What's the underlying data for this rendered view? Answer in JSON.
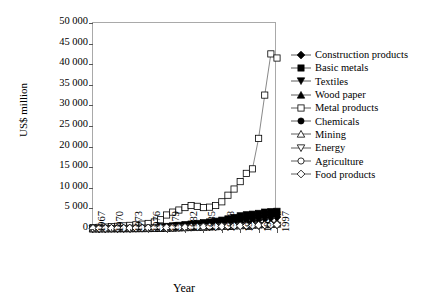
{
  "chart_data": {
    "type": "line",
    "title": "",
    "xlabel": "Year",
    "ylabel": "US$ million",
    "xlim": [
      1967,
      1997
    ],
    "ylim": [
      0,
      50000
    ],
    "ytick_labels": [
      "50 000",
      "45 000",
      "40 000",
      "35 000",
      "30 000",
      "25 000",
      "20 000",
      "15 000",
      "10 000",
      "5 000",
      "0"
    ],
    "ytick_values": [
      50000,
      45000,
      40000,
      35000,
      30000,
      25000,
      20000,
      15000,
      10000,
      5000,
      0
    ],
    "xtick_labels": [
      "1967",
      "1970",
      "1973",
      "1976",
      "1979",
      "1982",
      "1985",
      "1988",
      "1991",
      "1994",
      "1997"
    ],
    "xtick_values": [
      1967,
      1970,
      1973,
      1976,
      1979,
      1982,
      1985,
      1988,
      1991,
      1994,
      1997
    ],
    "grid": false,
    "legend_position": "right",
    "x": [
      1967,
      1968,
      1969,
      1970,
      1971,
      1972,
      1973,
      1974,
      1975,
      1976,
      1977,
      1978,
      1979,
      1980,
      1981,
      1982,
      1983,
      1984,
      1985,
      1986,
      1987,
      1988,
      1989,
      1990,
      1991,
      1992,
      1993,
      1994,
      1995,
      1996,
      1997
    ],
    "series": [
      {
        "name": "Construction products",
        "marker": "filled-diamond",
        "values": [
          40,
          45,
          50,
          60,
          70,
          85,
          110,
          140,
          170,
          200,
          240,
          290,
          340,
          400,
          470,
          540,
          610,
          690,
          770,
          860,
          960,
          1080,
          1220,
          1380,
          1560,
          1760,
          1980,
          2250,
          2600,
          2750,
          2900
        ]
      },
      {
        "name": "Basic metals",
        "marker": "filled-square",
        "values": [
          90,
          100,
          115,
          135,
          160,
          190,
          230,
          280,
          330,
          390,
          460,
          540,
          640,
          760,
          900,
          1050,
          1200,
          1360,
          1520,
          1700,
          1900,
          2150,
          2450,
          2800,
          3200,
          3450,
          3600,
          3800,
          4100,
          4200,
          4300
        ]
      },
      {
        "name": "Textiles",
        "marker": "filled-down-triangle",
        "values": [
          60,
          65,
          75,
          85,
          100,
          120,
          145,
          175,
          205,
          240,
          285,
          335,
          395,
          465,
          540,
          620,
          700,
          790,
          880,
          980,
          1100,
          1240,
          1400,
          1580,
          1780,
          1980,
          2150,
          2350,
          2600,
          2700,
          2800
        ]
      },
      {
        "name": "Wood paper",
        "marker": "filled-up-triangle",
        "values": [
          30,
          33,
          38,
          44,
          52,
          62,
          75,
          90,
          108,
          128,
          152,
          180,
          212,
          250,
          292,
          338,
          385,
          436,
          490,
          548,
          614,
          694,
          788,
          894,
          1014,
          1134,
          1240,
          1360,
          1500,
          1560,
          1620
        ]
      },
      {
        "name": "Metal products",
        "marker": "open-square",
        "values": [
          350,
          400,
          470,
          560,
          650,
          760,
          880,
          1020,
          1180,
          1350,
          1700,
          2250,
          3400,
          4100,
          4600,
          5200,
          5700,
          5500,
          5200,
          5300,
          5700,
          6600,
          8200,
          9700,
          11500,
          13500,
          14600,
          22000,
          32500,
          42500,
          41500
        ]
      },
      {
        "name": "Chemicals",
        "marker": "filled-circle",
        "values": [
          70,
          78,
          88,
          100,
          118,
          140,
          168,
          200,
          240,
          285,
          340,
          400,
          475,
          560,
          660,
          765,
          870,
          985,
          1100,
          1230,
          1380,
          1560,
          1770,
          2000,
          2270,
          2560,
          2820,
          3200,
          3700,
          3900,
          4050
        ]
      },
      {
        "name": "Mining",
        "marker": "open-up-triangle",
        "values": [
          120,
          125,
          130,
          140,
          150,
          165,
          180,
          200,
          220,
          240,
          265,
          290,
          320,
          350,
          385,
          420,
          455,
          490,
          530,
          570,
          615,
          660,
          710,
          760,
          820,
          880,
          940,
          1010,
          1100,
          1150,
          1200
        ]
      },
      {
        "name": "Energy",
        "marker": "open-down-triangle",
        "values": [
          80,
          84,
          90,
          96,
          104,
          114,
          125,
          138,
          152,
          168,
          186,
          205,
          227,
          250,
          276,
          303,
          330,
          358,
          388,
          418,
          450,
          485,
          522,
          560,
          600,
          642,
          686,
          732,
          790,
          820,
          850
        ]
      },
      {
        "name": "Agriculture",
        "marker": "open-circle",
        "values": [
          200,
          205,
          212,
          220,
          230,
          242,
          255,
          270,
          286,
          304,
          324,
          346,
          370,
          396,
          424,
          454,
          486,
          520,
          556,
          594,
          634,
          676,
          720,
          766,
          814,
          864,
          916,
          970,
          1030,
          1070,
          1110
        ]
      },
      {
        "name": "Food products",
        "marker": "open-diamond",
        "values": [
          160,
          165,
          172,
          180,
          190,
          202,
          215,
          230,
          246,
          264,
          284,
          306,
          330,
          356,
          384,
          414,
          446,
          480,
          516,
          554,
          594,
          636,
          680,
          726,
          774,
          824,
          876,
          930,
          990,
          1030,
          1070
        ]
      }
    ]
  }
}
